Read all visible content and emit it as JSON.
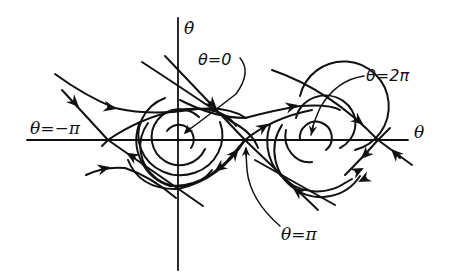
{
  "diagram": {
    "axes": {
      "x_label": "θ",
      "y_label": "θ̇"
    },
    "annotations": {
      "theta_zero": "θ=0",
      "theta_two_pi": "θ=2π",
      "theta_minus_pi": "θ=−π",
      "theta_pi": "θ=π"
    },
    "equilibria": [
      {
        "type": "saddle",
        "theta": "−π"
      },
      {
        "type": "stable-spiral",
        "theta": "0"
      },
      {
        "type": "saddle",
        "theta": "π"
      },
      {
        "type": "stable-spiral",
        "theta": "2π"
      },
      {
        "type": "saddle",
        "theta": "3π"
      }
    ],
    "colors": {
      "stroke": "#111111",
      "background": "#ffffff"
    }
  }
}
